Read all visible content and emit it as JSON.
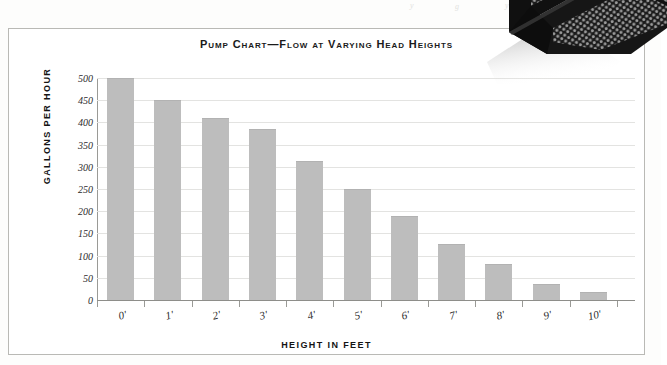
{
  "page": {
    "bleed_marks": [
      "y",
      "g",
      "y"
    ]
  },
  "chart_data": {
    "type": "bar",
    "title": "Pump Chart—Flow at Varying Head Heights",
    "xlabel": "HEIGHT IN FEET",
    "ylabel": "GALLONS PER HOUR",
    "categories": [
      "0'",
      "1'",
      "2'",
      "3'",
      "4'",
      "5'",
      "6'",
      "7'",
      "8'",
      "9'",
      "10'"
    ],
    "values": [
      500,
      450,
      410,
      385,
      313,
      250,
      190,
      126,
      81,
      36,
      18
    ],
    "ylim": [
      0,
      500
    ],
    "yticks": [
      0,
      50,
      100,
      150,
      200,
      250,
      300,
      350,
      400,
      450,
      500
    ],
    "ytick_labels": [
      "0",
      "50",
      "100",
      "150",
      "200",
      "250",
      "300",
      "350",
      "400",
      "450",
      "500"
    ],
    "grid": true,
    "legend": false,
    "bar_color": "#bdbdbd",
    "gridline_color": "#e3e3e1",
    "axis_color": "#9a9a96",
    "text_color": "#1a1a1a"
  },
  "overlay": {
    "photo_name": "perforated-basket-photo",
    "photo_color": "#111111"
  }
}
